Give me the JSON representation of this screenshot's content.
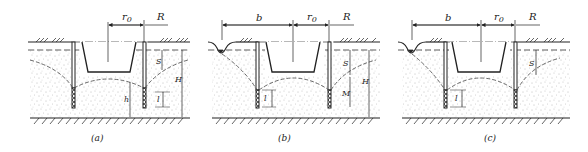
{
  "figure": {
    "panels": [
      {
        "caption": "(a)",
        "labels": {
          "r0": "r",
          "r0_sub": "0",
          "R": "R",
          "S": "S",
          "l": "l",
          "h": "h",
          "H": "H"
        }
      },
      {
        "caption": "(b)",
        "labels": {
          "b": "b",
          "r0": "r",
          "r0_sub": "0",
          "R": "R",
          "S": "S",
          "l": "l",
          "M": "M",
          "H": "H"
        }
      },
      {
        "caption": "(c)",
        "labels": {
          "b": "b",
          "r0": "r",
          "r0_sub": "0",
          "R": "R",
          "S": "S",
          "l": "l"
        }
      }
    ],
    "colors": {
      "line": "#222222",
      "sand": "#888888",
      "background": "#ffffff"
    }
  }
}
